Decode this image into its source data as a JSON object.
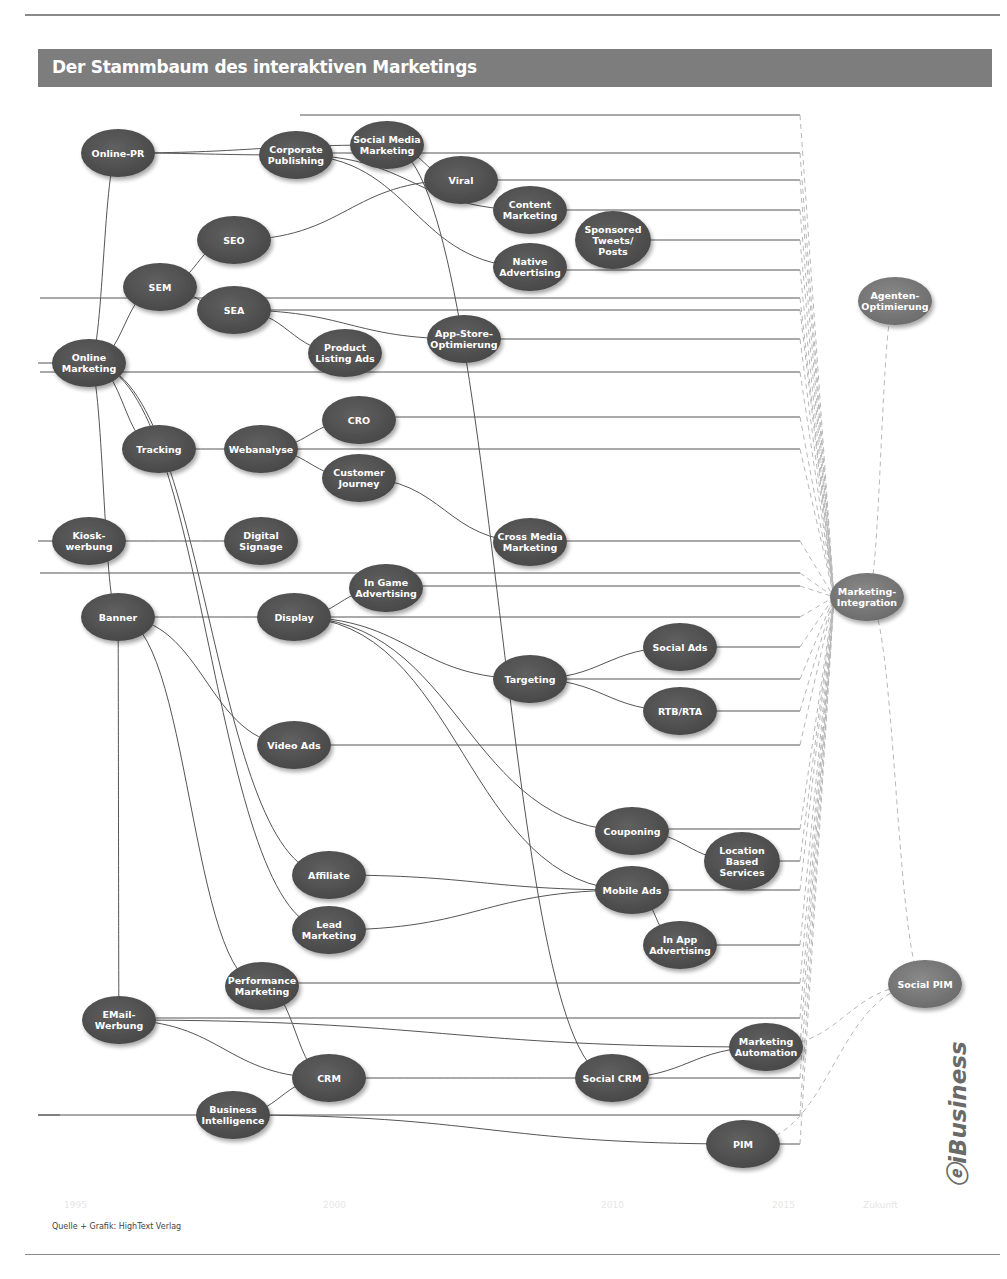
{
  "header": {
    "title": "Der Stammbaum des interaktiven Marketings"
  },
  "timeline": [
    "1995",
    "2000",
    "2010",
    "2015",
    "Zukunft"
  ],
  "footer": {
    "source": "Quelle + Grafik: HighText Verlag",
    "logo": "iBusiness",
    "logo_sub": "Zukunftsforschung für interaktives Business"
  },
  "colors": {
    "node_fill": "#525252",
    "node_fill_light": "#777777",
    "edge": "#555555",
    "dashed": "#b8b8b8",
    "title_bar": "#7d7d7d"
  },
  "chart_data": {
    "type": "tree-diagram",
    "title": "Der Stammbaum des interaktiven Marketings",
    "nodes": [
      {
        "id": "online_pr",
        "label": [
          "Online-PR"
        ],
        "x": 118,
        "y": 153
      },
      {
        "id": "corporate_publishing",
        "label": [
          "Corporate",
          "Publishing"
        ],
        "x": 296,
        "y": 155
      },
      {
        "id": "social_media_marketing",
        "label": [
          "Social Media",
          "Marketing"
        ],
        "x": 387,
        "y": 145
      },
      {
        "id": "viral",
        "label": [
          "Viral"
        ],
        "x": 461,
        "y": 180
      },
      {
        "id": "content_marketing",
        "label": [
          "Content",
          "Marketing"
        ],
        "x": 530,
        "y": 210
      },
      {
        "id": "sponsored_tweets",
        "label": [
          "Sponsored",
          "Tweets/",
          "Posts"
        ],
        "x": 613,
        "y": 240
      },
      {
        "id": "native_advertising",
        "label": [
          "Native",
          "Advertising"
        ],
        "x": 530,
        "y": 267
      },
      {
        "id": "seo",
        "label": [
          "SEO"
        ],
        "x": 234,
        "y": 240
      },
      {
        "id": "sem",
        "label": [
          "SEM"
        ],
        "x": 160,
        "y": 287
      },
      {
        "id": "sea",
        "label": [
          "SEA"
        ],
        "x": 234,
        "y": 310
      },
      {
        "id": "product_listing_ads",
        "label": [
          "Product",
          "Listing Ads"
        ],
        "x": 345,
        "y": 353
      },
      {
        "id": "app_store",
        "label": [
          "App-Store-",
          "Optimierung"
        ],
        "x": 464,
        "y": 339
      },
      {
        "id": "online_marketing",
        "label": [
          "Online",
          "Marketing"
        ],
        "x": 89,
        "y": 363
      },
      {
        "id": "agenten",
        "label": [
          "Agenten-",
          "Optimierung"
        ],
        "x": 895,
        "y": 301
      },
      {
        "id": "tracking",
        "label": [
          "Tracking"
        ],
        "x": 159,
        "y": 449
      },
      {
        "id": "webanalyse",
        "label": [
          "Webanalyse"
        ],
        "x": 261,
        "y": 449
      },
      {
        "id": "cro",
        "label": [
          "CRO"
        ],
        "x": 359,
        "y": 420
      },
      {
        "id": "customer_journey",
        "label": [
          "Customer",
          "Journey"
        ],
        "x": 359,
        "y": 478
      },
      {
        "id": "kiosk",
        "label": [
          "Kiosk-",
          "werbung"
        ],
        "x": 89,
        "y": 541
      },
      {
        "id": "digital_signage",
        "label": [
          "Digital",
          "Signage"
        ],
        "x": 261,
        "y": 541
      },
      {
        "id": "cross_media",
        "label": [
          "Cross Media",
          "Marketing"
        ],
        "x": 530,
        "y": 542
      },
      {
        "id": "in_game",
        "label": [
          "In Game",
          "Advertising"
        ],
        "x": 386,
        "y": 588
      },
      {
        "id": "banner",
        "label": [
          "Banner"
        ],
        "x": 118,
        "y": 617
      },
      {
        "id": "display",
        "label": [
          "Display"
        ],
        "x": 294,
        "y": 617
      },
      {
        "id": "marketing_integration",
        "label": [
          "Marketing-",
          "Integration"
        ],
        "x": 867,
        "y": 597
      },
      {
        "id": "social_ads",
        "label": [
          "Social Ads"
        ],
        "x": 680,
        "y": 647
      },
      {
        "id": "targeting",
        "label": [
          "Targeting"
        ],
        "x": 530,
        "y": 679
      },
      {
        "id": "rtb_rta",
        "label": [
          "RTB/RTA"
        ],
        "x": 680,
        "y": 711
      },
      {
        "id": "video_ads",
        "label": [
          "Video Ads"
        ],
        "x": 294,
        "y": 745
      },
      {
        "id": "couponing",
        "label": [
          "Couponing"
        ],
        "x": 632,
        "y": 831
      },
      {
        "id": "location_based",
        "label": [
          "Location",
          "Based",
          "Services"
        ],
        "x": 742,
        "y": 861
      },
      {
        "id": "affiliate",
        "label": [
          "Affiliate"
        ],
        "x": 329,
        "y": 875
      },
      {
        "id": "mobile_ads",
        "label": [
          "Mobile Ads"
        ],
        "x": 632,
        "y": 890
      },
      {
        "id": "lead_marketing",
        "label": [
          "Lead",
          "Marketing"
        ],
        "x": 329,
        "y": 930
      },
      {
        "id": "in_app",
        "label": [
          "In App",
          "Advertising"
        ],
        "x": 680,
        "y": 945
      },
      {
        "id": "performance_marketing",
        "label": [
          "Performance",
          "Marketing"
        ],
        "x": 262,
        "y": 986
      },
      {
        "id": "social_pim",
        "label": [
          "Social PIM"
        ],
        "x": 925,
        "y": 984
      },
      {
        "id": "email",
        "label": [
          "EMail-",
          "Werbung"
        ],
        "x": 119,
        "y": 1020
      },
      {
        "id": "marketing_automation",
        "label": [
          "Marketing",
          "Automation"
        ],
        "x": 766,
        "y": 1047
      },
      {
        "id": "crm",
        "label": [
          "CRM"
        ],
        "x": 329,
        "y": 1078
      },
      {
        "id": "social_crm",
        "label": [
          "Social CRM"
        ],
        "x": 612,
        "y": 1078
      },
      {
        "id": "business_intelligence",
        "label": [
          "Business",
          "Intelligence"
        ],
        "x": 233,
        "y": 1115
      },
      {
        "id": "pim",
        "label": [
          "PIM"
        ],
        "x": 743,
        "y": 1144
      }
    ],
    "edges": [
      [
        "online_marketing",
        "online_pr"
      ],
      [
        "online_pr",
        "corporate_publishing"
      ],
      [
        "online_pr",
        "social_media_marketing"
      ],
      [
        "corporate_publishing",
        "content_marketing"
      ],
      [
        "corporate_publishing",
        "native_advertising"
      ],
      [
        "social_media_marketing",
        "viral"
      ],
      [
        "social_media_marketing",
        "social_crm"
      ],
      [
        "online_marketing",
        "sem"
      ],
      [
        "sem",
        "seo"
      ],
      [
        "sem",
        "sea"
      ],
      [
        "seo",
        "viral"
      ],
      [
        "sea",
        "product_listing_ads"
      ],
      [
        "sea",
        "app_store"
      ],
      [
        "online_marketing",
        "tracking"
      ],
      [
        "tracking",
        "webanalyse"
      ],
      [
        "webanalyse",
        "cro"
      ],
      [
        "webanalyse",
        "customer_journey"
      ],
      [
        "customer_journey",
        "cross_media"
      ],
      [
        "kiosk",
        "digital_signage"
      ],
      [
        "online_marketing",
        "banner"
      ],
      [
        "banner",
        "display"
      ],
      [
        "banner",
        "video_ads"
      ],
      [
        "display",
        "in_game"
      ],
      [
        "display",
        "targeting"
      ],
      [
        "display",
        "couponing"
      ],
      [
        "display",
        "mobile_ads"
      ],
      [
        "targeting",
        "social_ads"
      ],
      [
        "targeting",
        "rtb_rta"
      ],
      [
        "couponing",
        "location_based"
      ],
      [
        "mobile_ads",
        "in_app"
      ],
      [
        "online_marketing",
        "affiliate"
      ],
      [
        "online_marketing",
        "lead_marketing"
      ],
      [
        "affiliate",
        "mobile_ads"
      ],
      [
        "lead_marketing",
        "mobile_ads"
      ],
      [
        "banner",
        "performance_marketing"
      ],
      [
        "banner",
        "email"
      ],
      [
        "performance_marketing",
        "crm"
      ],
      [
        "email",
        "crm"
      ],
      [
        "crm",
        "business_intelligence"
      ],
      [
        "crm",
        "social_crm"
      ],
      [
        "social_crm",
        "marketing_automation"
      ],
      [
        "email",
        "marketing_automation"
      ],
      [
        "business_intelligence",
        "pim"
      ],
      [
        "agenten",
        "marketing_integration"
      ],
      [
        "marketing_integration",
        "social_pim"
      ],
      [
        "social_pim",
        "marketing_automation"
      ],
      [
        "social_pim",
        "pim"
      ]
    ],
    "lanes_y": [
      115,
      153,
      180,
      210,
      240,
      270,
      298,
      310,
      339,
      372,
      417,
      449,
      541,
      573,
      586,
      617,
      647,
      679,
      711,
      745,
      829,
      861,
      890,
      945,
      983,
      1018,
      1047,
      1078,
      1115,
      1144
    ],
    "lane_end_x": 800,
    "x_axis": [
      "1995",
      "2000",
      "2010",
      "2015",
      "Zukunft"
    ]
  }
}
